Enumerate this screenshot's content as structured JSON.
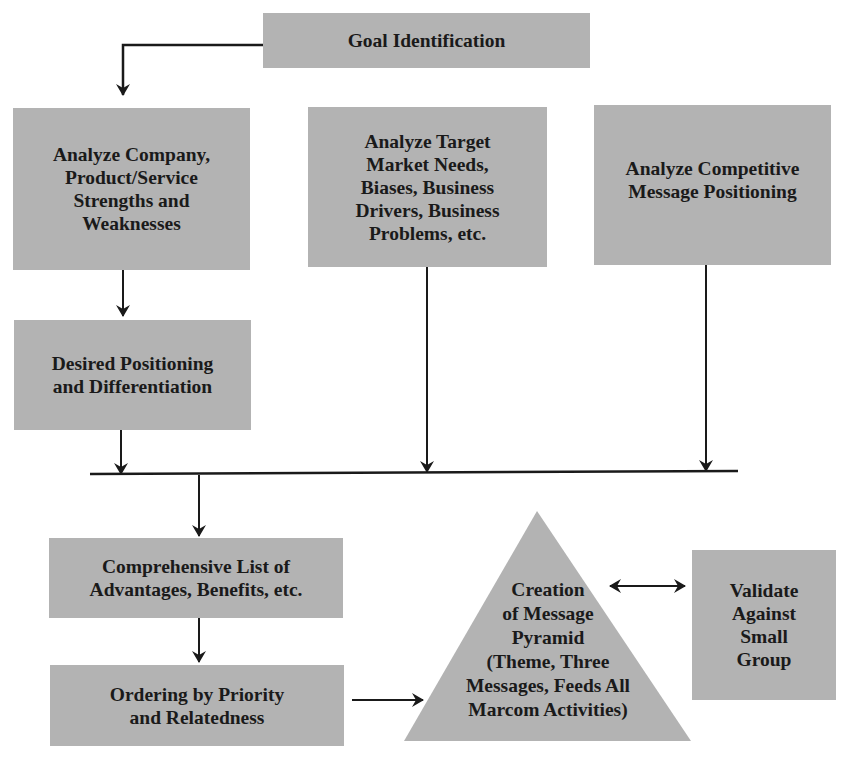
{
  "diagram": {
    "type": "flowchart",
    "colors": {
      "box_fill": "#b3b3b3",
      "line": "#1a1a1a",
      "text": "#1a1a1a",
      "background": "#ffffff"
    },
    "nodes": {
      "goal": {
        "label": "Goal Identification"
      },
      "company": {
        "label": "Analyze Company,\nProduct/Service\nStrengths and\nWeaknesses"
      },
      "target": {
        "label": "Analyze Target\nMarket Needs,\nBiases, Business\nDrivers, Business\nProblems, etc."
      },
      "competitive": {
        "label": "Analyze Competitive\nMessage Positioning"
      },
      "positioning": {
        "label": "Desired Positioning\nand Differentiation"
      },
      "comprehensive": {
        "label": "Comprehensive List of\nAdvantages, Benefits, etc."
      },
      "ordering": {
        "label": "Ordering by Priority\nand Relatedness"
      },
      "pyramid": {
        "label": "Creation\nof Message\nPyramid\n(Theme, Three\nMessages, Feeds All\nMarcom Activities)",
        "shape": "triangle"
      },
      "validate": {
        "label": "Validate\nAgainst\nSmall\nGroup"
      }
    },
    "edges": [
      {
        "from": "goal",
        "to": "company",
        "type": "arrow"
      },
      {
        "from": "company",
        "to": "positioning",
        "type": "arrow"
      },
      {
        "from": "positioning",
        "to": "merge-bar",
        "type": "arrow"
      },
      {
        "from": "target",
        "to": "merge-bar",
        "type": "arrow"
      },
      {
        "from": "competitive",
        "to": "merge-bar",
        "type": "arrow"
      },
      {
        "from": "merge-bar",
        "to": "comprehensive",
        "type": "arrow"
      },
      {
        "from": "comprehensive",
        "to": "ordering",
        "type": "arrow"
      },
      {
        "from": "ordering",
        "to": "pyramid",
        "type": "arrow"
      },
      {
        "from": "pyramid",
        "to": "validate",
        "type": "double-arrow"
      }
    ]
  }
}
